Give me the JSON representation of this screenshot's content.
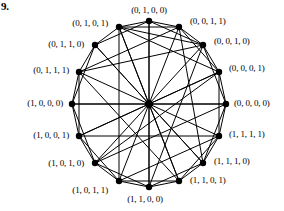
{
  "figure": {
    "number": "9.",
    "caption": ""
  },
  "graph": {
    "type": "hypercube-Q4-circular",
    "center": {
      "x": 149,
      "y": 104,
      "radius": 4.2
    },
    "circle": {
      "cx": 149,
      "cy": 104,
      "rx": 78,
      "ry": 82
    },
    "vertex_radius": 3.2,
    "edge_color": "#000000",
    "vertex_color": "#000000",
    "edge_width": 1.0,
    "vertices": [
      {
        "id": 0,
        "label": "(0, 1, 0, 0)",
        "x": 149,
        "y": 21,
        "label_x": 149,
        "label_y": 10,
        "align": "c"
      },
      {
        "id": 1,
        "label": "(0, 0, 1, 1)",
        "x": 179,
        "y": 27,
        "label_x": 190,
        "label_y": 21,
        "align": "l"
      },
      {
        "id": 2,
        "label": "(0, 0, 1, 0)",
        "x": 203,
        "y": 45,
        "label_x": 214,
        "label_y": 41,
        "align": "l"
      },
      {
        "id": 3,
        "label": "(0, 0, 0, 1)",
        "x": 219,
        "y": 72,
        "label_x": 229,
        "label_y": 68,
        "align": "l"
      },
      {
        "id": 4,
        "label": "(0, 0, 0, 0)",
        "x": 226,
        "y": 104,
        "label_x": 234,
        "label_y": 103,
        "align": "l"
      },
      {
        "id": 5,
        "label": "(1, 1, 1, 1)",
        "x": 219,
        "y": 136,
        "label_x": 229,
        "label_y": 134,
        "align": "l"
      },
      {
        "id": 6,
        "label": "(1, 1, 1, 0)",
        "x": 203,
        "y": 163,
        "label_x": 214,
        "label_y": 161,
        "align": "l"
      },
      {
        "id": 7,
        "label": "(1, 1, 0, 1)",
        "x": 179,
        "y": 181,
        "label_x": 190,
        "label_y": 180,
        "align": "l"
      },
      {
        "id": 8,
        "label": "(1, 1, 0, 0)",
        "x": 149,
        "y": 187,
        "label_x": 145,
        "label_y": 199,
        "align": "c"
      },
      {
        "id": 9,
        "label": "(1, 0, 1, 1)",
        "x": 119,
        "y": 181,
        "label_x": 108,
        "label_y": 190,
        "align": "r"
      },
      {
        "id": 10,
        "label": "(1, 0, 1, 0)",
        "x": 95,
        "y": 163,
        "label_x": 84,
        "label_y": 163,
        "align": "r"
      },
      {
        "id": 11,
        "label": "(1, 0, 0, 1)",
        "x": 79,
        "y": 136,
        "label_x": 69,
        "label_y": 135,
        "align": "r"
      },
      {
        "id": 12,
        "label": "(1, 0, 0, 0)",
        "x": 72,
        "y": 104,
        "label_x": 63,
        "label_y": 103,
        "align": "r"
      },
      {
        "id": 13,
        "label": "(0, 1, 1, 1)",
        "x": 79,
        "y": 72,
        "label_x": 69,
        "label_y": 70,
        "align": "r"
      },
      {
        "id": 14,
        "label": "(0, 1, 1, 0)",
        "x": 95,
        "y": 45,
        "label_x": 84,
        "label_y": 44,
        "align": "r"
      },
      {
        "id": 15,
        "label": "(0, 1, 0, 1)",
        "x": 119,
        "y": 27,
        "label_x": 108,
        "label_y": 23,
        "align": "r"
      }
    ],
    "hub_edges_note": "every vertex connects to the central hub",
    "edges": [
      [
        0,
        1
      ],
      [
        0,
        2
      ],
      [
        0,
        14
      ],
      [
        0,
        15
      ],
      [
        0,
        8
      ],
      [
        1,
        2
      ],
      [
        1,
        3
      ],
      [
        1,
        15
      ],
      [
        1,
        6
      ],
      [
        2,
        3
      ],
      [
        2,
        4
      ],
      [
        2,
        13
      ],
      [
        3,
        4
      ],
      [
        3,
        5
      ],
      [
        3,
        10
      ],
      [
        4,
        5
      ],
      [
        4,
        6
      ],
      [
        4,
        12
      ],
      [
        5,
        6
      ],
      [
        5,
        7
      ],
      [
        5,
        11
      ],
      [
        6,
        7
      ],
      [
        6,
        8
      ],
      [
        6,
        14
      ],
      [
        7,
        8
      ],
      [
        7,
        9
      ],
      [
        7,
        13
      ],
      [
        8,
        9
      ],
      [
        8,
        10
      ],
      [
        9,
        10
      ],
      [
        9,
        11
      ],
      [
        9,
        15
      ],
      [
        10,
        11
      ],
      [
        10,
        12
      ],
      [
        11,
        12
      ],
      [
        11,
        13
      ],
      [
        12,
        13
      ],
      [
        12,
        14
      ],
      [
        13,
        14
      ],
      [
        14,
        15
      ],
      [
        15,
        2
      ],
      [
        15,
        3
      ],
      [
        2,
        8
      ],
      [
        4,
        10
      ],
      [
        5,
        9
      ],
      [
        1,
        13
      ],
      [
        3,
        11
      ],
      [
        7,
        15
      ]
    ]
  }
}
